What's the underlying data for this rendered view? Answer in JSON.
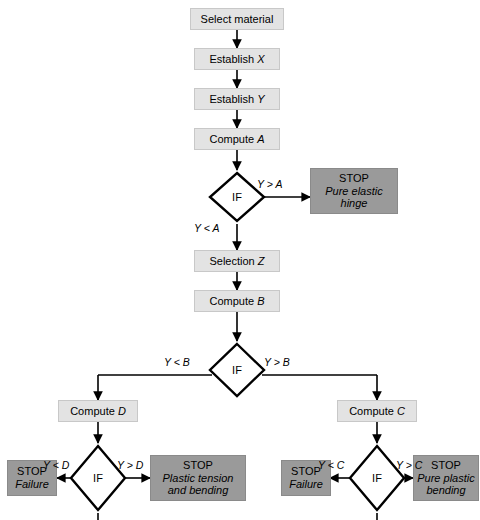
{
  "diagram": {
    "colors": {
      "process_fill": "#e3e3e3",
      "terminator_fill": "#9a9a9a",
      "decision_fill": "#ffffff",
      "line": "#000000",
      "background": "#ffffff"
    }
  },
  "nodes": {
    "select_material": {
      "label": "Select material"
    },
    "establish_x": {
      "label_prefix": "Establish ",
      "label_var": "X"
    },
    "establish_y": {
      "label_prefix": "Establish ",
      "label_var": "Y"
    },
    "compute_a": {
      "label_prefix": "Compute ",
      "label_var": "A"
    },
    "decision_a": {
      "label": "IF"
    },
    "stop_pure_elastic_hinge": {
      "stop": "STOP",
      "line1": "Pure elastic",
      "line2": "hinge"
    },
    "selection_z": {
      "label_prefix": "Selection ",
      "label_var": "Z"
    },
    "compute_b": {
      "label_prefix": "Compute ",
      "label_var": "B"
    },
    "decision_b": {
      "label": "IF"
    },
    "compute_d": {
      "label_prefix": "Compute ",
      "label_var": "D"
    },
    "compute_c": {
      "label_prefix": "Compute ",
      "label_var": "C"
    },
    "decision_d": {
      "label": "IF"
    },
    "decision_c": {
      "label": "IF"
    },
    "stop_failure_left": {
      "stop": "STOP",
      "line1": "Failure"
    },
    "stop_plastic_tension": {
      "stop": "STOP",
      "line1": "Plastic tension",
      "line2": "and bending"
    },
    "stop_failure_right": {
      "stop": "STOP",
      "line1": "Failure"
    },
    "stop_pure_plastic_bending": {
      "stop": "STOP",
      "line1": "Pure plastic",
      "line2": "bending"
    }
  },
  "edge_labels": {
    "y_gt_a": "Y > A",
    "y_lt_a": "Y < A",
    "y_lt_b": "Y < B",
    "y_gt_b": "Y > B",
    "y_lt_d": "Y < D",
    "y_gt_d": "Y > D",
    "y_lt_c": "Y < C",
    "y_gt_c": "Y > C"
  }
}
